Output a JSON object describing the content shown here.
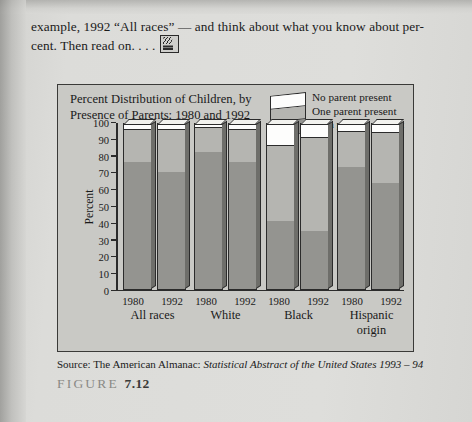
{
  "page": {
    "intro_lines": [
      "example, 1992 “All races” — and think about what you know about per-",
      "cent. Then read on. . . ."
    ],
    "pencil_icon": "writing-hand-icon",
    "source_prefix": "Source: The American Almanac: ",
    "source_italic": "Statistical Abstract of the United States 1993 – 94",
    "figure_word": "FIGURE",
    "figure_number": "7.12"
  },
  "colors": {
    "no_parent": "#fdfdfc",
    "one_parent": "#b5b5b1",
    "both_parents": "#949490",
    "outline": "#2b2b2b",
    "panel": "#c9c9c5",
    "paper": "#dcdcd9"
  },
  "chart_data": {
    "type": "bar",
    "title": "Percent Distribution of Children, by Presence of Parents: 1980 and 1992",
    "title_lines": [
      "Percent Distribution of Children, by",
      "Presence of Parents: 1980 and 1992"
    ],
    "xlabel": "",
    "ylabel": "Percent",
    "ylim": [
      0,
      100
    ],
    "yticks": [
      100,
      90,
      80,
      70,
      60,
      50,
      40,
      30,
      20,
      10,
      0
    ],
    "grid": false,
    "stacked": true,
    "legend_position": "top-right",
    "legend": [
      {
        "label": "No parent present",
        "color": "#fdfdfc",
        "key": "no_parent"
      },
      {
        "label": "One parent present",
        "color": "#b5b5b1",
        "key": "one_parent"
      },
      {
        "label": "Both parents present",
        "color": "#949490",
        "key": "both_parents"
      }
    ],
    "groups": [
      {
        "name": "All races",
        "bars": [
          {
            "year": "1980",
            "both_parents": 77,
            "one_parent": 20,
            "no_parent": 3
          },
          {
            "year": "1992",
            "both_parents": 71,
            "one_parent": 26,
            "no_parent": 3
          }
        ]
      },
      {
        "name": "White",
        "bars": [
          {
            "year": "1980",
            "both_parents": 83,
            "one_parent": 15,
            "no_parent": 2
          },
          {
            "year": "1992",
            "both_parents": 77,
            "one_parent": 20,
            "no_parent": 3
          }
        ]
      },
      {
        "name": "Black",
        "bars": [
          {
            "year": "1980",
            "both_parents": 41,
            "one_parent": 46,
            "no_parent": 13
          }
        ]
      },
      {
        "name": "Hispanic origin",
        "bars": [
          {
            "year": "1980",
            "both_parents": 74,
            "one_parent": 22,
            "no_parent": 4
          },
          {
            "year": "1992",
            "both_parents": 64,
            "one_parent": 31,
            "no_parent": 5
          }
        ]
      }
    ],
    "groups_full": [
      {
        "name": "All races",
        "bars": [
          {
            "year": "1980",
            "both_parents": 77,
            "one_parent": 20,
            "no_parent": 3
          },
          {
            "year": "1992",
            "both_parents": 71,
            "one_parent": 26,
            "no_parent": 3
          }
        ]
      },
      {
        "name": "White",
        "bars": [
          {
            "year": "1980",
            "both_parents": 83,
            "one_parent": 15,
            "no_parent": 2
          },
          {
            "year": "1992",
            "both_parents": 77,
            "one_parent": 20,
            "no_parent": 3
          }
        ]
      },
      {
        "name": "Black",
        "bars": [
          {
            "year": "1980",
            "both_parents": 41,
            "one_parent": 46,
            "no_parent": 13
          },
          {
            "year": "1992",
            "both_parents": 35,
            "one_parent": 57,
            "no_parent": 8
          }
        ]
      },
      {
        "name": "Hispanic origin",
        "bars": [
          {
            "year": "1980",
            "both_parents": 74,
            "one_parent": 22,
            "no_parent": 4
          },
          {
            "year": "1992",
            "both_parents": 64,
            "one_parent": 31,
            "no_parent": 5
          }
        ]
      }
    ]
  }
}
